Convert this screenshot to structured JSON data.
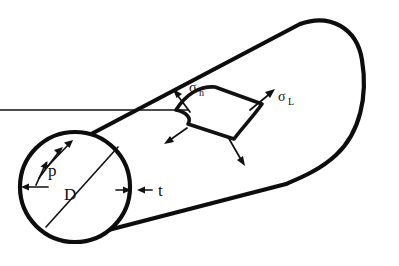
{
  "figure": {
    "kind": "engineering-diagram",
    "background_color": "#ffffff",
    "line_color": "#0d0d0d"
  },
  "labels": {
    "pressure": "p",
    "diameter": "D",
    "thickness": "t",
    "hoop_stress_symbol": "σ",
    "hoop_stress_subscript": "h",
    "longitudinal_stress_symbol": "σ",
    "longitudinal_stress_subscript": "L"
  },
  "annotations": {
    "pressure_arrow_count": 4,
    "thickness_arrow_count": 2,
    "element_arrow_count": 4
  },
  "geometry": {
    "end_circle_center_x": 75,
    "end_circle_center_y": 187,
    "end_circle_radius": 55,
    "cap_right_x": 360,
    "cap_top_y": 22
  }
}
